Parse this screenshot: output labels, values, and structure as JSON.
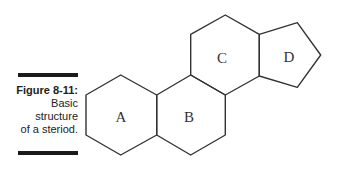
{
  "caption": {
    "title": "Figure 8-11:",
    "lines": [
      "Basic",
      "structure",
      "of a steriod."
    ]
  },
  "diagram": {
    "rings": [
      {
        "label": "A"
      },
      {
        "label": "B"
      },
      {
        "label": "C"
      },
      {
        "label": "D"
      }
    ],
    "stroke_color": "#333333"
  }
}
